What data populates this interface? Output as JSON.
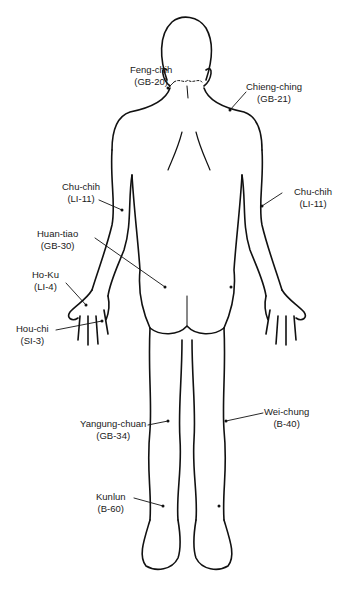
{
  "figure": {
    "ink_color": "#111111",
    "background": "#ffffff"
  },
  "points": [
    {
      "id": "feng-chih",
      "name": "Feng-chih",
      "code": "(GB-20)"
    },
    {
      "id": "chieng-ching",
      "name": "Chieng-ching",
      "code": "(GB-21)"
    },
    {
      "id": "chu-chih-left",
      "name": "Chu-chih",
      "code": "(LI-11)"
    },
    {
      "id": "chu-chih-right",
      "name": "Chu-chih",
      "code": "(LI-11)"
    },
    {
      "id": "huan-tiao",
      "name": "Huan-tiao",
      "code": "(GB-30)"
    },
    {
      "id": "ho-ku",
      "name": "Ho-Ku",
      "code": "(LI-4)"
    },
    {
      "id": "hou-chi",
      "name": "Hou-chi",
      "code": "(SI-3)"
    },
    {
      "id": "yangung-chuan",
      "name": "Yangung-chuan",
      "code": "(GB-34)"
    },
    {
      "id": "wei-chung",
      "name": "Wei-chung",
      "code": "(B-40)"
    },
    {
      "id": "kunlun",
      "name": "Kunlun",
      "code": "(B-60)"
    }
  ]
}
